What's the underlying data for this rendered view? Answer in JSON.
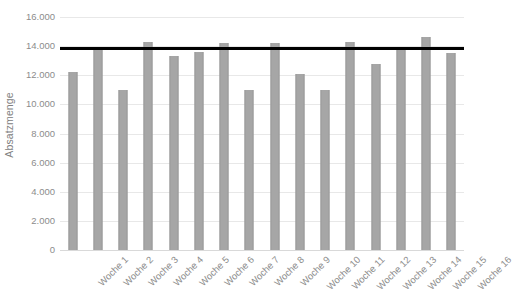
{
  "chart_data": {
    "type": "bar",
    "title": "",
    "xlabel": "",
    "ylabel": "Absatzmenge",
    "categories": [
      "Woche 1",
      "Woche 2",
      "Woche 3",
      "Woche 4",
      "Woche 5",
      "Woche 6",
      "Woche 7",
      "Woche 8",
      "Woche 9",
      "Woche 10",
      "Woche 11",
      "Woche 12",
      "Woche 13",
      "Woche 14",
      "Woche 15",
      "Woche 16"
    ],
    "values": [
      12200,
      13800,
      11000,
      14300,
      13300,
      13600,
      14200,
      11000,
      14200,
      12100,
      11000,
      14300,
      12800,
      13900,
      14600,
      13500
    ],
    "series": [
      {
        "name": "Absatzmenge",
        "type": "bar",
        "color": "#a6a6a6",
        "values": [
          12200,
          13800,
          11000,
          14300,
          13300,
          13600,
          14200,
          11000,
          14200,
          12100,
          11000,
          14300,
          12800,
          13900,
          14600,
          13500
        ]
      },
      {
        "name": "Referenzlinie",
        "type": "line",
        "color": "#000000",
        "constant_value": 13900
      }
    ],
    "ylim": [
      0,
      16000
    ],
    "ytick_values": [
      0,
      2000,
      4000,
      6000,
      8000,
      10000,
      12000,
      14000,
      16000
    ],
    "ytick_labels": [
      "0",
      "2.000",
      "4.000",
      "6.000",
      "8.000",
      "10.000",
      "12.000",
      "14.000",
      "16.000"
    ],
    "grid": true,
    "grid_axis": "y",
    "legend": false,
    "legend_position": "none"
  },
  "colors": {
    "bar": "#a6a6a6",
    "bar_edge": "#9a9a9a",
    "reference_line": "#000000",
    "gridline": "#e8e8e8",
    "text": "#8c8c8c",
    "background": "#ffffff"
  }
}
